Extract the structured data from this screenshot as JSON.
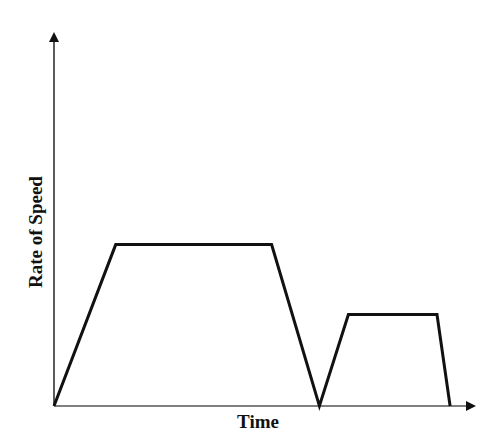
{
  "chart_data": {
    "type": "line",
    "title": "",
    "xlabel": "Time",
    "ylabel": "Rate of Speed",
    "grid": false,
    "legend": null,
    "x_ticks": [],
    "y_ticks": [],
    "xlim": [
      0,
      100
    ],
    "ylim": [
      0,
      100
    ],
    "series": [
      {
        "name": "Speed profile",
        "points": [
          {
            "x": 0,
            "y": 0
          },
          {
            "x": 14.7,
            "y": 43.4
          },
          {
            "x": 51.8,
            "y": 43.4
          },
          {
            "x": 63.2,
            "y": 0
          },
          {
            "x": 70.1,
            "y": 24.6
          },
          {
            "x": 91.2,
            "y": 24.6
          },
          {
            "x": 94.3,
            "y": 0
          }
        ]
      }
    ],
    "colors": {
      "line": "#111111",
      "axis": "#333333",
      "background": "#ffffff"
    }
  },
  "labels": {
    "x": "Time",
    "y": "Rate of Speed"
  },
  "layout": {
    "origin": [
      54,
      406
    ],
    "x_end": 477,
    "y_end": 30,
    "px_per_unit_x": 4.2,
    "px_per_unit_y": 3.72
  }
}
